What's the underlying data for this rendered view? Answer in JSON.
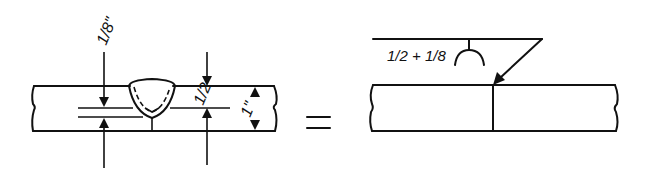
{
  "diagram": {
    "left": {
      "name": "weld-cross-section",
      "dimensions": {
        "root_opening": "1/8\"",
        "groove_depth": "1/2",
        "plate_thickness": "1\""
      }
    },
    "equals": "=",
    "right": {
      "name": "weld-symbol-drawing",
      "symbol_text": "1/2 + 1/8",
      "symbol_type": "U-groove (arc) below reference line"
    }
  }
}
